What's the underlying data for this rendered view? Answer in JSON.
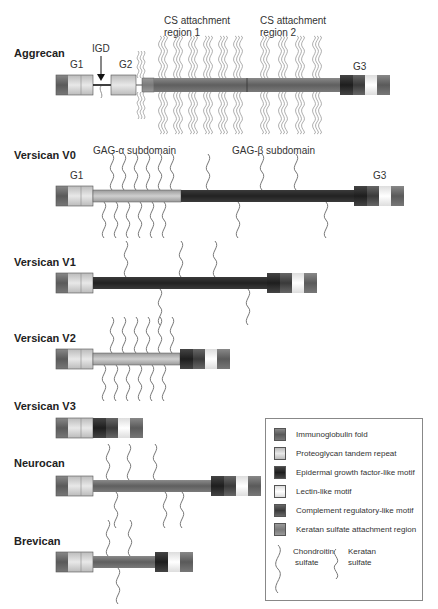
{
  "colors": {
    "immunoglobulin_fold": "#6a6a6a",
    "proteoglycan_tandem_repeat": "#d6d6d6",
    "egf_like_motif": "#2a2a2a",
    "lectin_like_motif": "#f2f2f2",
    "complement_regulatory_like_motif": "#4a4a4a",
    "keratan_sulfate_region": "#8a8a8a",
    "core_dark": "#2b2b2b",
    "core_mid": "#6f6f6f",
    "core_light": "#b5b5b5"
  },
  "proteins": [
    {
      "name": "Aggrecan",
      "labels": {
        "g1": "G1",
        "igd": "IGD",
        "g2": "G2",
        "g3": "G3",
        "cs1": "CS attachment",
        "cs1b": "region 1",
        "cs2": "CS attachment",
        "cs2b": "region 2"
      }
    },
    {
      "name": "Versican V0",
      "labels": {
        "g1": "G1",
        "g3": "G3",
        "alpha": "GAG-α subdomain",
        "beta": "GAG-β subdomain"
      }
    },
    {
      "name": "Versican V1"
    },
    {
      "name": "Versican V2"
    },
    {
      "name": "Versican V3"
    },
    {
      "name": "Neurocan"
    },
    {
      "name": "Brevican"
    }
  ],
  "legend": {
    "items": [
      {
        "label": "Immunoglobulin fold",
        "icon": "immunoglobulin-fold-swatch"
      },
      {
        "label": "Proteoglycan tandem repeat",
        "icon": "tandem-repeat-swatch"
      },
      {
        "label": "Epidermal growth factor-like motif",
        "icon": "egf-swatch"
      },
      {
        "label": "Lectin-like motif",
        "icon": "lectin-swatch"
      },
      {
        "label": "Complement regulatory-like motif",
        "icon": "complement-swatch"
      },
      {
        "label": "Keratan sulfate attachment region",
        "icon": "keratan-region-swatch"
      }
    ],
    "chondroitin": "Chondroitin",
    "chondroitin2": "sulfate",
    "keratan": "Keratan",
    "keratan2": "sulfate"
  }
}
